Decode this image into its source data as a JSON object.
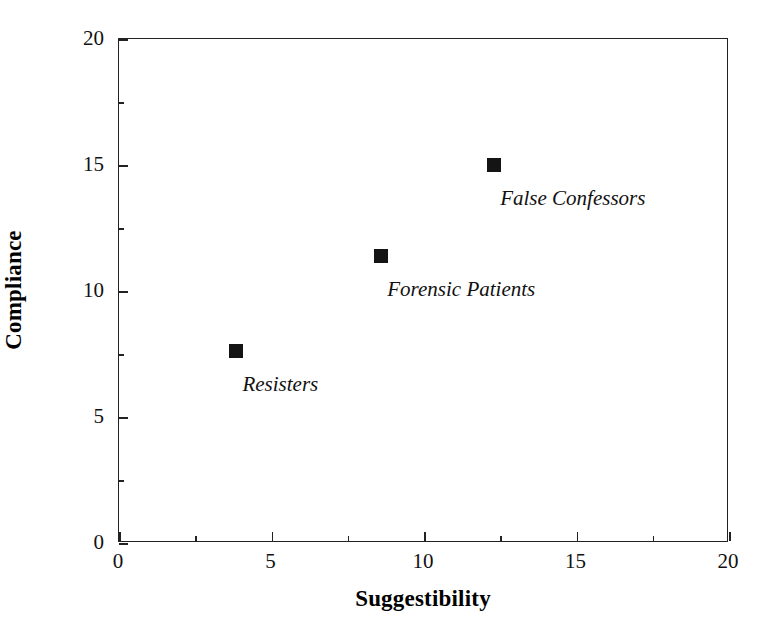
{
  "chart_data": {
    "type": "scatter",
    "title": "",
    "xlabel": "Suggestibility",
    "ylabel": "Compliance",
    "xlim": [
      0,
      20
    ],
    "ylim": [
      0,
      20
    ],
    "grid": false,
    "legend": "none",
    "x_major_ticks": [
      0,
      5,
      10,
      15,
      20
    ],
    "x_minor_ticks": [
      2.5,
      7.5,
      12.5,
      17.5
    ],
    "y_major_ticks": [
      0,
      5,
      10,
      15,
      20
    ],
    "y_minor_ticks": [
      2.5,
      7.5,
      12.5,
      17.5
    ],
    "x_tick_labels": [
      "0",
      "5",
      "10",
      "15",
      "20"
    ],
    "y_tick_labels": [
      "0",
      "5",
      "10",
      "15",
      "20"
    ],
    "marker_color": "#141414",
    "marker_shape": "square",
    "points": [
      {
        "label": "Resisters",
        "x": 3.85,
        "y": 7.6,
        "label_dx": 6,
        "label_dy": 33
      },
      {
        "label": "Forensic Patients",
        "x": 8.6,
        "y": 11.4,
        "label_dx": 6,
        "label_dy": 33
      },
      {
        "label": "False Confessors",
        "x": 12.3,
        "y": 15.0,
        "label_dx": 6,
        "label_dy": 33
      }
    ]
  }
}
